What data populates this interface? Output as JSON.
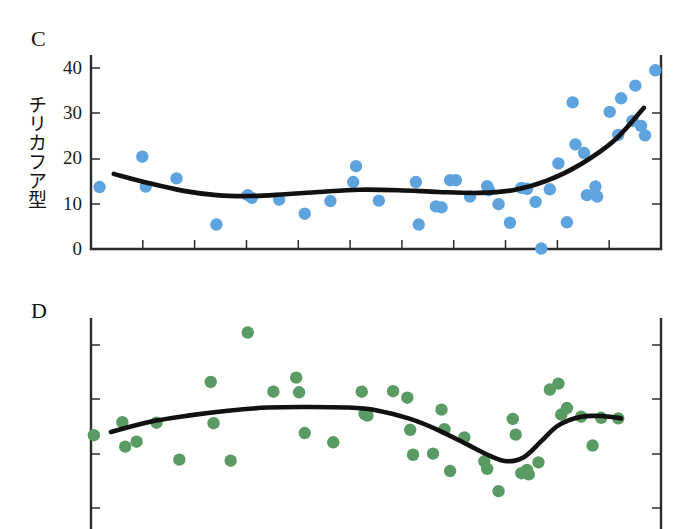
{
  "figure": {
    "background": "#ffffff",
    "panels": [
      "C",
      "D"
    ]
  },
  "panel_c": {
    "letter": "C",
    "axis_title": "チリカフア型",
    "ytick_labels": [
      "40",
      "30",
      "20",
      "10",
      "0"
    ],
    "dot_color": "#5fa3de",
    "line_color": "#111111"
  },
  "panel_d": {
    "letter": "D",
    "axis_title": "矢尻型",
    "ytick_labels": [
      "40",
      "30",
      "20",
      "10"
    ],
    "dot_color": "#5a9a63",
    "line_color": "#111111"
  },
  "chart_data": [
    {
      "type": "scatter",
      "panel": "C",
      "title": "C",
      "ylabel": "チリカフア型",
      "xlabel": "",
      "ylim": [
        0,
        43
      ],
      "xlim": [
        0,
        100
      ],
      "yticks": [
        0,
        10,
        20,
        30,
        40
      ],
      "xticks_count": 10,
      "xticks_labeled": false,
      "grid": false,
      "legend": "none",
      "marker_color": "#5fa3de",
      "points": [
        {
          "x": 1.5,
          "y": 13.7
        },
        {
          "x": 9.0,
          "y": 20.4
        },
        {
          "x": 9.6,
          "y": 13.8
        },
        {
          "x": 15.0,
          "y": 15.6
        },
        {
          "x": 22.0,
          "y": 5.4
        },
        {
          "x": 27.5,
          "y": 11.9
        },
        {
          "x": 28.2,
          "y": 11.3
        },
        {
          "x": 33.0,
          "y": 10.9
        },
        {
          "x": 37.5,
          "y": 7.8
        },
        {
          "x": 42.0,
          "y": 10.6
        },
        {
          "x": 46.5,
          "y": 18.3
        },
        {
          "x": 46.0,
          "y": 14.8
        },
        {
          "x": 50.5,
          "y": 10.7
        },
        {
          "x": 57.0,
          "y": 14.8
        },
        {
          "x": 57.5,
          "y": 5.4
        },
        {
          "x": 60.5,
          "y": 9.4
        },
        {
          "x": 61.5,
          "y": 9.2
        },
        {
          "x": 63.0,
          "y": 15.2
        },
        {
          "x": 64.0,
          "y": 15.2
        },
        {
          "x": 66.5,
          "y": 11.6
        },
        {
          "x": 69.5,
          "y": 13.9
        },
        {
          "x": 69.8,
          "y": 13.0
        },
        {
          "x": 71.5,
          "y": 9.9
        },
        {
          "x": 73.5,
          "y": 5.8
        },
        {
          "x": 75.5,
          "y": 13.5
        },
        {
          "x": 76.5,
          "y": 13.3
        },
        {
          "x": 78.0,
          "y": 10.4
        },
        {
          "x": 79.0,
          "y": 0.1
        },
        {
          "x": 80.5,
          "y": 13.2
        },
        {
          "x": 82.0,
          "y": 18.9
        },
        {
          "x": 83.5,
          "y": 5.9
        },
        {
          "x": 84.5,
          "y": 32.4
        },
        {
          "x": 85.0,
          "y": 23.1
        },
        {
          "x": 86.5,
          "y": 21.2
        },
        {
          "x": 87.0,
          "y": 11.9
        },
        {
          "x": 88.5,
          "y": 13.8
        },
        {
          "x": 88.8,
          "y": 11.6
        },
        {
          "x": 91.0,
          "y": 30.3
        },
        {
          "x": 92.5,
          "y": 25.2
        },
        {
          "x": 93.0,
          "y": 33.3
        },
        {
          "x": 95.0,
          "y": 28.3
        },
        {
          "x": 95.5,
          "y": 36.1
        },
        {
          "x": 96.5,
          "y": 27.2
        },
        {
          "x": 97.2,
          "y": 25.1
        },
        {
          "x": 99.0,
          "y": 39.5
        }
      ],
      "fit_curve": [
        {
          "x": 4.0,
          "y": 16.6
        },
        {
          "x": 10.0,
          "y": 14.6
        },
        {
          "x": 16.0,
          "y": 12.9
        },
        {
          "x": 22.0,
          "y": 11.9
        },
        {
          "x": 28.0,
          "y": 11.7
        },
        {
          "x": 34.0,
          "y": 12.1
        },
        {
          "x": 40.0,
          "y": 12.6
        },
        {
          "x": 47.0,
          "y": 13.1
        },
        {
          "x": 54.0,
          "y": 13.0
        },
        {
          "x": 61.0,
          "y": 12.6
        },
        {
          "x": 68.0,
          "y": 12.4
        },
        {
          "x": 74.0,
          "y": 13.0
        },
        {
          "x": 80.0,
          "y": 15.1
        },
        {
          "x": 86.0,
          "y": 18.8
        },
        {
          "x": 92.0,
          "y": 24.2
        },
        {
          "x": 97.0,
          "y": 31.2
        }
      ]
    },
    {
      "type": "scatter",
      "panel": "D",
      "title": "D",
      "ylabel": "矢尻型",
      "xlabel": "",
      "ylim": [
        5,
        45
      ],
      "xlim": [
        0,
        100
      ],
      "yticks": [
        10,
        20,
        30,
        40
      ],
      "xticks_count": 10,
      "xticks_labeled": false,
      "grid": false,
      "legend": "none",
      "marker_color": "#5a9a63",
      "points": [
        {
          "x": 0.5,
          "y": 23.4
        },
        {
          "x": 5.5,
          "y": 25.8
        },
        {
          "x": 6.0,
          "y": 21.3
        },
        {
          "x": 8.0,
          "y": 22.2
        },
        {
          "x": 11.5,
          "y": 25.7
        },
        {
          "x": 15.5,
          "y": 18.9
        },
        {
          "x": 21.0,
          "y": 33.2
        },
        {
          "x": 21.5,
          "y": 25.6
        },
        {
          "x": 24.5,
          "y": 18.7
        },
        {
          "x": 27.5,
          "y": 42.3
        },
        {
          "x": 32.0,
          "y": 31.4
        },
        {
          "x": 36.0,
          "y": 34.0
        },
        {
          "x": 36.5,
          "y": 31.3
        },
        {
          "x": 37.5,
          "y": 23.8
        },
        {
          "x": 42.5,
          "y": 22.1
        },
        {
          "x": 47.5,
          "y": 31.4
        },
        {
          "x": 48.0,
          "y": 27.3
        },
        {
          "x": 48.5,
          "y": 27.0
        },
        {
          "x": 53.0,
          "y": 31.5
        },
        {
          "x": 55.5,
          "y": 30.3
        },
        {
          "x": 56.0,
          "y": 24.4
        },
        {
          "x": 56.5,
          "y": 19.8
        },
        {
          "x": 60.0,
          "y": 20.0
        },
        {
          "x": 61.5,
          "y": 28.1
        },
        {
          "x": 62.0,
          "y": 24.5
        },
        {
          "x": 63.0,
          "y": 16.8
        },
        {
          "x": 65.5,
          "y": 23.0
        },
        {
          "x": 69.0,
          "y": 18.6
        },
        {
          "x": 69.5,
          "y": 17.2
        },
        {
          "x": 71.5,
          "y": 13.1
        },
        {
          "x": 74.0,
          "y": 26.4
        },
        {
          "x": 74.5,
          "y": 23.5
        },
        {
          "x": 75.5,
          "y": 16.4
        },
        {
          "x": 76.5,
          "y": 17.0
        },
        {
          "x": 76.8,
          "y": 16.2
        },
        {
          "x": 78.5,
          "y": 18.4
        },
        {
          "x": 80.5,
          "y": 31.8
        },
        {
          "x": 82.0,
          "y": 32.9
        },
        {
          "x": 82.5,
          "y": 27.2
        },
        {
          "x": 83.5,
          "y": 28.4
        },
        {
          "x": 86.0,
          "y": 26.8
        },
        {
          "x": 88.0,
          "y": 21.5
        },
        {
          "x": 89.5,
          "y": 26.6
        },
        {
          "x": 92.5,
          "y": 26.5
        }
      ],
      "fit_curve": [
        {
          "x": 3.5,
          "y": 24.0
        },
        {
          "x": 10.0,
          "y": 25.8
        },
        {
          "x": 17.0,
          "y": 27.0
        },
        {
          "x": 24.0,
          "y": 27.9
        },
        {
          "x": 31.0,
          "y": 28.5
        },
        {
          "x": 38.0,
          "y": 28.6
        },
        {
          "x": 45.0,
          "y": 28.5
        },
        {
          "x": 50.0,
          "y": 28.0
        },
        {
          "x": 56.0,
          "y": 26.4
        },
        {
          "x": 61.0,
          "y": 24.3
        },
        {
          "x": 66.0,
          "y": 21.7
        },
        {
          "x": 70.0,
          "y": 19.6
        },
        {
          "x": 73.0,
          "y": 18.6
        },
        {
          "x": 76.0,
          "y": 19.4
        },
        {
          "x": 79.0,
          "y": 22.3
        },
        {
          "x": 82.0,
          "y": 25.2
        },
        {
          "x": 86.0,
          "y": 26.8
        },
        {
          "x": 90.0,
          "y": 26.9
        },
        {
          "x": 93.0,
          "y": 26.5
        }
      ]
    }
  ]
}
